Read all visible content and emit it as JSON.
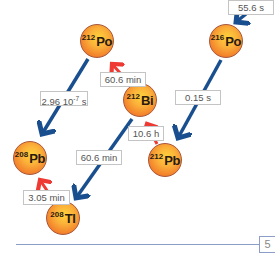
{
  "diagram": {
    "type": "radioactive-decay-chain",
    "nuclides": [
      {
        "id": "po216",
        "mass": "216",
        "symbol": "Po"
      },
      {
        "id": "pb212",
        "mass": "212",
        "symbol": "Pb"
      },
      {
        "id": "bi212",
        "mass": "212",
        "symbol": "Bi"
      },
      {
        "id": "po212",
        "mass": "212",
        "symbol": "Po"
      },
      {
        "id": "tl208",
        "mass": "208",
        "symbol": "Tl"
      },
      {
        "id": "pb208",
        "mass": "208",
        "symbol": "Pb"
      }
    ],
    "half_lives": {
      "into_po216": "55.6 s",
      "po216_to_pb212": "0.15 s",
      "pb212_to_bi212": "10.6 h",
      "bi212_to_po212": "60.6 min",
      "bi212_to_tl208": "60.6 min",
      "po212_to_pb208": "2.96 10",
      "po212_to_pb208_exp": "-7",
      "po212_to_pb208_unit": " s",
      "tl208_to_pb208": "3.05 min"
    },
    "colors": {
      "alpha_arrow": "#1a4f8f",
      "beta_arrow": "#ee3a33",
      "nucleus_fill": "#f5902e"
    }
  },
  "footer": {
    "page_number": "5"
  }
}
